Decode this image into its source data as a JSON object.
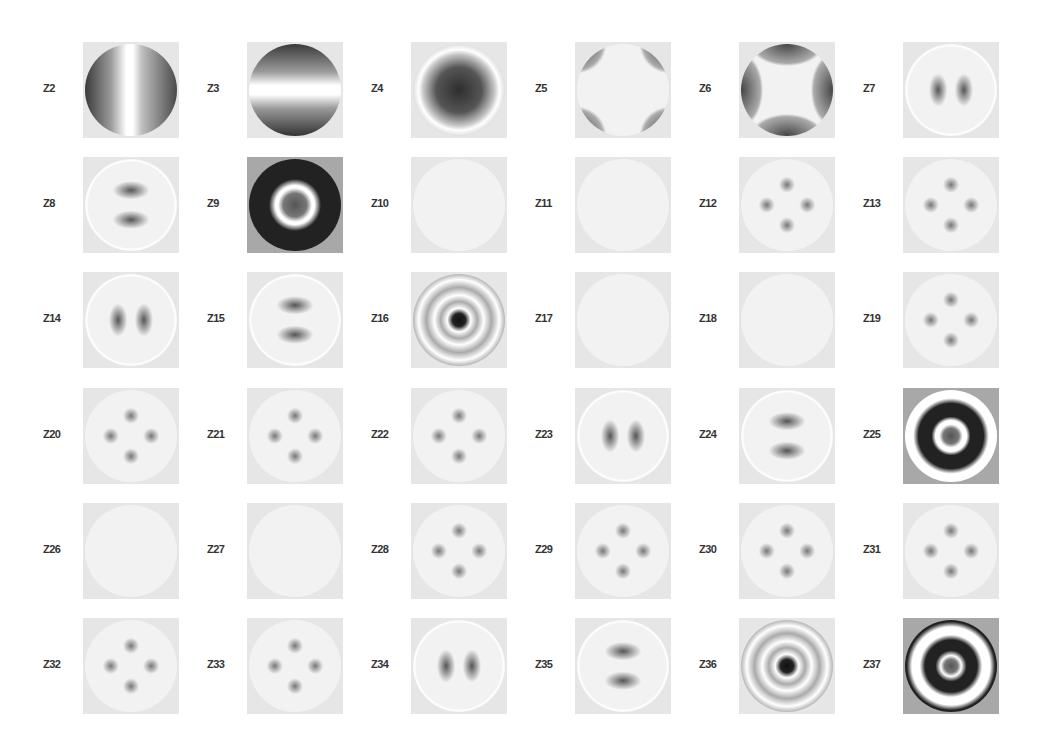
{
  "figure": {
    "title": "",
    "grid": {
      "rows": 6,
      "cols": 6
    },
    "terms": [
      {
        "label": "Z2",
        "pattern": "tilt-x"
      },
      {
        "label": "Z3",
        "pattern": "tilt-y"
      },
      {
        "label": "Z4",
        "pattern": "defocus"
      },
      {
        "label": "Z5",
        "pattern": "astig-0"
      },
      {
        "label": "Z6",
        "pattern": "astig-45"
      },
      {
        "label": "Z7",
        "pattern": "coma-x"
      },
      {
        "label": "Z8",
        "pattern": "coma-y"
      },
      {
        "label": "Z9",
        "pattern": "spherical"
      },
      {
        "label": "Z10",
        "pattern": "trefoil-6"
      },
      {
        "label": "Z11",
        "pattern": "trefoil-6b"
      },
      {
        "label": "Z12",
        "pattern": "quad-4"
      },
      {
        "label": "Z13",
        "pattern": "quad-4b"
      },
      {
        "label": "Z14",
        "pattern": "coma2-x"
      },
      {
        "label": "Z15",
        "pattern": "coma2-y"
      },
      {
        "label": "Z16",
        "pattern": "spherical2"
      },
      {
        "label": "Z17",
        "pattern": "edge-8"
      },
      {
        "label": "Z18",
        "pattern": "edge-8b"
      },
      {
        "label": "Z19",
        "pattern": "lobes-6"
      },
      {
        "label": "Z20",
        "pattern": "lobes-6b"
      },
      {
        "label": "Z21",
        "pattern": "lobes-4"
      },
      {
        "label": "Z22",
        "pattern": "lobes-4b"
      },
      {
        "label": "Z23",
        "pattern": "coma3-x"
      },
      {
        "label": "Z24",
        "pattern": "coma3-y"
      },
      {
        "label": "Z25",
        "pattern": "spherical3"
      },
      {
        "label": "Z26",
        "pattern": "edge-10"
      },
      {
        "label": "Z27",
        "pattern": "edge-10b"
      },
      {
        "label": "Z28",
        "pattern": "lobes-8"
      },
      {
        "label": "Z29",
        "pattern": "lobes-8b"
      },
      {
        "label": "Z30",
        "pattern": "lobes-6c"
      },
      {
        "label": "Z31",
        "pattern": "lobes-6d"
      },
      {
        "label": "Z32",
        "pattern": "lobes-4c"
      },
      {
        "label": "Z33",
        "pattern": "lobes-4d"
      },
      {
        "label": "Z34",
        "pattern": "coma4-x"
      },
      {
        "label": "Z35",
        "pattern": "coma4-y"
      },
      {
        "label": "Z36",
        "pattern": "spherical4"
      },
      {
        "label": "Z37",
        "pattern": "spherical5"
      }
    ]
  }
}
